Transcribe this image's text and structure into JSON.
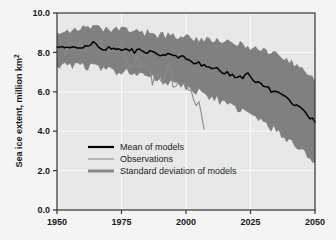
{
  "chart_data": {
    "type": "line",
    "title": "",
    "xlabel": "",
    "ylabel": "Sea ice extent, million km2",
    "ylabel_base": "Sea ice extent, million km",
    "ylabel_sup": "2",
    "xlim": [
      1950,
      2050
    ],
    "ylim": [
      0.0,
      10.0
    ],
    "grid": true,
    "legend_position": "center-left-lower",
    "xticks": [
      1950,
      1975,
      2000,
      2025,
      2050
    ],
    "xtick_labels": [
      "1950",
      "1975",
      "2000",
      "2025",
      "2050"
    ],
    "yticks": [
      0.0,
      2.0,
      4.0,
      6.0,
      8.0,
      10.0
    ],
    "ytick_labels": [
      "0.0",
      "2.0",
      "4.0",
      "6.0",
      "8.0",
      "10.0"
    ],
    "colors": {
      "mean_line": "#000000",
      "observations_line": "#8a8a8a",
      "band_fill": "#808080",
      "plot_background": "#e8e8e8",
      "figure_background": "#f4f4f4",
      "axis": "#333333",
      "gridline": "#ffffff",
      "text": "#1a1a1a"
    },
    "series": [
      {
        "name": "Mean of models",
        "style": "thick-black-line",
        "x": [
          1950,
          1952,
          1954,
          1956,
          1958,
          1960,
          1962,
          1964,
          1966,
          1968,
          1970,
          1972,
          1974,
          1976,
          1978,
          1980,
          1982,
          1984,
          1986,
          1988,
          1990,
          1992,
          1994,
          1996,
          1998,
          2000,
          2002,
          2004,
          2006,
          2008,
          2010,
          2012,
          2014,
          2016,
          2018,
          2020,
          2022,
          2024,
          2026,
          2028,
          2030,
          2032,
          2034,
          2036,
          2038,
          2040,
          2042,
          2044,
          2046,
          2048,
          2050
        ],
        "values": [
          8.3,
          8.25,
          8.35,
          8.2,
          8.3,
          8.25,
          8.4,
          8.45,
          8.3,
          8.2,
          8.25,
          8.15,
          8.2,
          8.1,
          8.15,
          8.05,
          8.1,
          8.0,
          8.05,
          7.95,
          7.9,
          7.95,
          7.85,
          7.8,
          7.75,
          7.7,
          7.55,
          7.5,
          7.4,
          7.35,
          7.25,
          7.15,
          7.05,
          6.95,
          6.85,
          6.7,
          6.75,
          6.95,
          6.6,
          6.45,
          6.3,
          6.15,
          6.0,
          5.95,
          5.7,
          5.55,
          5.4,
          5.25,
          5.0,
          4.7,
          4.5
        ]
      },
      {
        "name": "Observations",
        "style": "thin-gray-line",
        "x": [
          1953,
          1955,
          1957,
          1959,
          1961,
          1963,
          1965,
          1967,
          1969,
          1971,
          1973,
          1975,
          1977,
          1979,
          1981,
          1983,
          1985,
          1987,
          1989,
          1991,
          1993,
          1995,
          1997,
          1999,
          2001,
          2003,
          2005,
          2007
        ],
        "values": [
          8.1,
          8.3,
          8.2,
          8.45,
          8.3,
          8.5,
          8.15,
          8.6,
          8.0,
          8.4,
          7.9,
          8.3,
          7.6,
          7.3,
          7.8,
          7.0,
          7.4,
          6.6,
          6.9,
          6.3,
          7.6,
          6.2,
          6.5,
          6.3,
          6.1,
          5.6,
          5.5,
          4.2
        ]
      },
      {
        "name": "Standard deviation of models",
        "style": "gray-shaded-band",
        "x": [
          1950,
          1955,
          1960,
          1965,
          1970,
          1975,
          1980,
          1985,
          1990,
          1995,
          2000,
          2005,
          2010,
          2015,
          2020,
          2025,
          2030,
          2035,
          2040,
          2045,
          2050
        ],
        "upper": [
          9.1,
          9.15,
          9.2,
          9.25,
          9.1,
          9.2,
          9.05,
          9.0,
          8.9,
          8.85,
          8.8,
          8.7,
          8.6,
          8.5,
          8.45,
          8.3,
          8.1,
          7.9,
          7.6,
          7.2,
          6.5
        ],
        "lower": [
          7.4,
          7.3,
          7.35,
          7.2,
          7.1,
          7.0,
          6.9,
          6.8,
          6.6,
          6.4,
          6.2,
          6.0,
          5.7,
          5.4,
          5.1,
          4.8,
          4.4,
          4.0,
          3.5,
          3.0,
          2.2
        ]
      }
    ]
  },
  "legend": {
    "items": [
      {
        "label": "Mean of models",
        "swatch": "thick-black-line"
      },
      {
        "label": "Observations",
        "swatch": "thin-gray-line"
      },
      {
        "label": "Standard deviation of models",
        "swatch": "medium-gray-line"
      }
    ]
  }
}
